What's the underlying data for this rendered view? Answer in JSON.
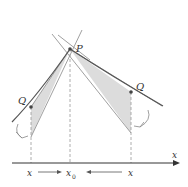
{
  "diagram": {
    "type": "secant-to-tangent illustration",
    "points": {
      "P": {
        "label": "P",
        "x": 70,
        "y": 49
      },
      "Q_left": {
        "label": "Q",
        "x": 31,
        "y": 107
      },
      "Q_right": {
        "label": "Q",
        "x": 131,
        "y": 92
      }
    },
    "axis": {
      "label": "x"
    },
    "tick_labels": {
      "left": "x",
      "center": "x",
      "center_subscript": "0",
      "right": "x"
    },
    "colors": {
      "curve": "#555555",
      "secant_fill": "#d9d9d9",
      "lines": "#777777",
      "axis": "#333333",
      "dashed": "#999999"
    }
  }
}
